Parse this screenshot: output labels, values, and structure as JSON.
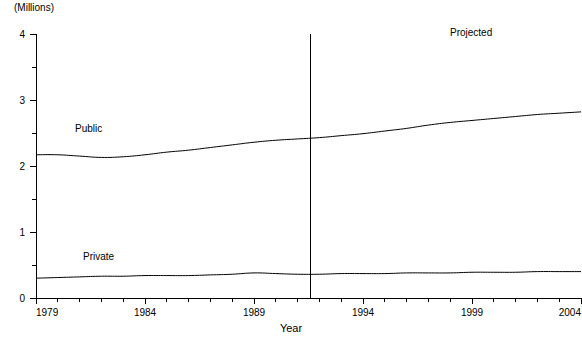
{
  "chart_data": {
    "type": "line",
    "title": "",
    "subtitle": "",
    "unit_label": "(Millions)",
    "xlabel": "Year",
    "ylabel": "",
    "xlim": [
      1979,
      2004
    ],
    "ylim": [
      0,
      4
    ],
    "grid": false,
    "legend_position": "inline",
    "y_ticks": [
      0,
      1,
      2,
      3,
      4
    ],
    "y_tick_labels": [
      "0",
      "1",
      "2",
      "3",
      "4"
    ],
    "y_minor_ticks": [
      0.5,
      1.5,
      2.5,
      3.5
    ],
    "x_ticks": [
      1979,
      1980,
      1981,
      1982,
      1983,
      1984,
      1985,
      1986,
      1987,
      1988,
      1989,
      1990,
      1991,
      1992,
      1993,
      1994,
      1995,
      1996,
      1997,
      1998,
      1999,
      2000,
      2001,
      2002,
      2003,
      2004
    ],
    "x_tick_labels": [
      "1979",
      "1984",
      "1989",
      "1994",
      "1999",
      "2004"
    ],
    "x_labeled_ticks": [
      1979,
      1984,
      1989,
      1994,
      1999,
      2004
    ],
    "x": [
      1979,
      1980,
      1981,
      1982,
      1983,
      1984,
      1985,
      1986,
      1987,
      1988,
      1989,
      1990,
      1991,
      1992,
      1993,
      1994,
      1995,
      1996,
      1997,
      1998,
      1999,
      2000,
      2001,
      2002,
      2003,
      2004
    ],
    "series": [
      {
        "name": "Public",
        "label": "Public",
        "color": "#000000",
        "values": [
          2.17,
          2.17,
          2.15,
          2.13,
          2.14,
          2.17,
          2.21,
          2.24,
          2.28,
          2.32,
          2.36,
          2.39,
          2.41,
          2.43,
          2.46,
          2.49,
          2.53,
          2.57,
          2.62,
          2.66,
          2.69,
          2.72,
          2.75,
          2.78,
          2.8,
          2.82
        ]
      },
      {
        "name": "Private",
        "label": "Private",
        "color": "#000000",
        "values": [
          0.3,
          0.31,
          0.32,
          0.33,
          0.33,
          0.34,
          0.34,
          0.34,
          0.35,
          0.36,
          0.38,
          0.37,
          0.36,
          0.36,
          0.37,
          0.37,
          0.37,
          0.38,
          0.38,
          0.38,
          0.39,
          0.39,
          0.39,
          0.4,
          0.4,
          0.4
        ]
      }
    ],
    "annotations": [
      {
        "name": "projected-note",
        "text": "Projected",
        "x": 1998.8,
        "y": 3.8
      }
    ],
    "divider": {
      "name": "projection-divider",
      "x": 1991.6,
      "y_from": 0,
      "y_to": 4
    }
  }
}
